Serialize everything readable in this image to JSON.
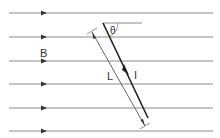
{
  "diagram": {
    "labels": {
      "field": "B",
      "length": "L",
      "current": "I",
      "angle": "θ"
    },
    "field_lines": {
      "count": 6,
      "y_positions": [
        13,
        37,
        61,
        84,
        108,
        131
      ],
      "x_start": 9,
      "x_end": 213,
      "arrow_x": 44,
      "direction": "right",
      "color": "#8a8a8a"
    },
    "conductor": {
      "x1": 103,
      "y1": 23,
      "x2": 148,
      "y2": 118,
      "color": "#222222"
    },
    "reference_line": {
      "x1": 103,
      "y1": 23,
      "x2": 142,
      "y2": 23
    },
    "colors": {
      "line": "#8a8a8a",
      "conductor": "#222222",
      "text": "#333333"
    }
  }
}
